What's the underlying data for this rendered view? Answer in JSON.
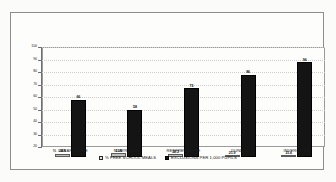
{
  "chart_data": {
    "type": "bar",
    "title": "",
    "xlabel": "",
    "ylabel": "",
    "ylim": [
      20,
      100
    ],
    "grid": true,
    "legend_position": "bottom",
    "categories": [
      "N. LANARKSHIRE",
      "N. AYRSHIRE",
      "RENFREWSHIRE",
      "DUNDEE",
      "INVERCLYDE"
    ],
    "y_ticks": [
      20,
      30,
      40,
      50,
      60,
      70,
      80,
      90,
      100
    ],
    "y_tick_labels": [
      "20",
      "30",
      "40",
      "50",
      "60",
      "70",
      "80",
      "90",
      "100"
    ],
    "series": [
      {
        "name": "% FREE SCHOOL MEALS",
        "color": "#bfbfbf",
        "values": [
          22.8,
          22.9,
          22.2,
          21.9,
          21.6
        ],
        "labels": [
          "22.8",
          "22.9",
          "22.2",
          "21.9",
          "21.6"
        ]
      },
      {
        "name": "EXCLUSIONS PER 1,000 PUPILS",
        "color": "#141414",
        "values": [
          66,
          58,
          75,
          86,
          96
        ],
        "labels": [
          "66",
          "58",
          "75",
          "86",
          "96"
        ]
      }
    ]
  },
  "legend": {
    "items": [
      {
        "label": "% FREE SCHOOL MEALS",
        "swatch": "light-gray-square"
      },
      {
        "label": "EXCLUSIONS PER 1,000 PUPILS",
        "swatch": "black-square"
      }
    ]
  }
}
